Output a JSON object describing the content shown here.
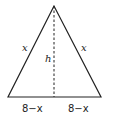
{
  "diagram": {
    "type": "isosceles-triangle",
    "labels": {
      "left_side": "x",
      "right_side": "x",
      "height": "h",
      "base_left": "8−x",
      "base_right": "8−x"
    },
    "colors": {
      "stroke": "#222222",
      "background": "#ffffff"
    }
  }
}
